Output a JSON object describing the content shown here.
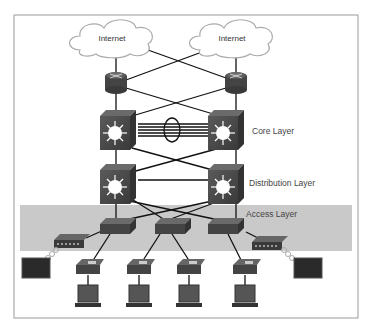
{
  "diagram": {
    "clouds": [
      {
        "label": "Internet"
      },
      {
        "label": "Internet"
      }
    ],
    "layers": {
      "core": "Core Layer",
      "distribution": "Distribution Layer",
      "access": "Access Layer"
    },
    "colors": {
      "device": "#4a4a4a",
      "device_top": "#6a6a6a",
      "access_band": "#c9c9c9",
      "frame": "#9a9a9a",
      "link": "#111111"
    },
    "devices": {
      "routers": 2,
      "core_switches": 2,
      "distribution_switches": 2,
      "access_switches": 3,
      "wireless_access_points": 2,
      "laptops": 2,
      "ip_phones": 4,
      "pcs": 4
    }
  }
}
